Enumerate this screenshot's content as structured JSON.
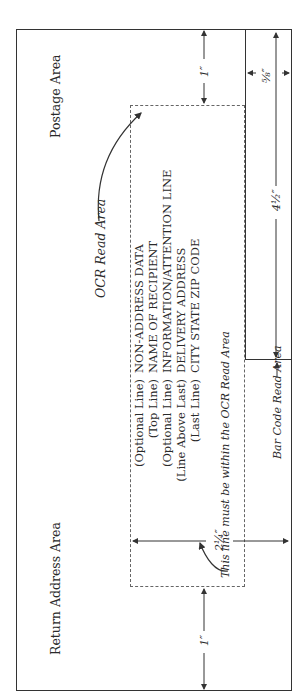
{
  "diagram": {
    "title_areas": {
      "return_address": "Return Address Area",
      "postage": "Postage Area",
      "ocr": "OCR Read Area",
      "bar_code": "Bar Code Read Area"
    },
    "address_lines": [
      {
        "label": "(Optional Line)",
        "value": "NON-ADDRESS DATA"
      },
      {
        "label": "(Top Line)",
        "value": "NAME OF RECIPIENT"
      },
      {
        "label": "(Optional Line)",
        "value": "INFORMATION/ATTENTION LINE"
      },
      {
        "label": "(Line Above Last)",
        "value": "DELIVERY ADDRESS"
      },
      {
        "label": "(Last Line)",
        "value": "CITY STATE ZIP CODE"
      }
    ],
    "note": "This line must be within the OCR Read Area",
    "dimensions": {
      "left_margin": "1″",
      "right_margin": "1″",
      "ocr_height": "2¼″",
      "bar_code_width": "4½″",
      "bar_code_height": "⅝″"
    },
    "colors": {
      "line": "#333333",
      "dashed": "#666666",
      "text": "#2a2a2a"
    }
  }
}
